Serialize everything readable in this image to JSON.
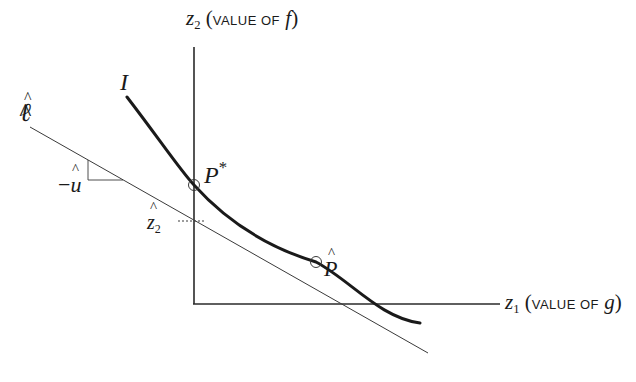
{
  "diagram": {
    "y_axis": {
      "var_label": "z",
      "var_sub": "2",
      "caption_open": "(",
      "caption": "VALUE OF",
      "caption_fn": "f",
      "caption_close": ")"
    },
    "x_axis": {
      "var_label": "z",
      "var_sub": "1",
      "caption_open": "(",
      "caption": "VALUE OF",
      "caption_fn": "g",
      "caption_close": ")"
    },
    "curve_label": "I",
    "line_label": "ℓ",
    "slope_label": {
      "minus": "−",
      "symbol": "u"
    },
    "intercept_label": {
      "symbol": "z",
      "sub": "2"
    },
    "points": [
      {
        "name": "P*",
        "base": "P",
        "sup": "*",
        "x": 194,
        "y": 185
      },
      {
        "name": "P-hat",
        "base": "P",
        "x": 316,
        "y": 262
      }
    ],
    "colors": {
      "ink": "#1a1a1a",
      "axis": "#2a2a2a",
      "thin_line": "#3a3a3a"
    }
  }
}
